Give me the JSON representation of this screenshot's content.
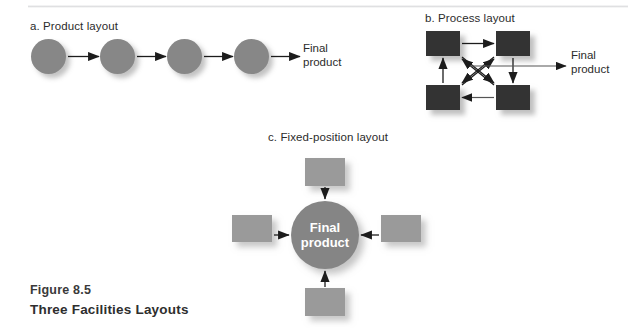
{
  "figure": {
    "caption_line1": "Figure 8.5",
    "caption_line2": "Three Facilities Layouts"
  },
  "panels": {
    "a": {
      "label": "a. Product layout",
      "output_label_line1": "Final",
      "output_label_line2": "product",
      "node_count": 4,
      "node_shape": "circle",
      "node_color": "#878787",
      "flow": "linear-sequence"
    },
    "b": {
      "label": "b. Process layout",
      "output_label_line1": "Final",
      "output_label_line2": "product",
      "node_count": 4,
      "node_shape": "square",
      "node_color": "#333333",
      "flow": "cyclic-with-diagonals"
    },
    "c": {
      "label": "c. Fixed-position layout",
      "center_label_line1": "Final",
      "center_label_line2": "product",
      "node_count": 4,
      "node_shape": "square",
      "node_color": "#9a9a9a",
      "center_color": "#858585",
      "flow": "inward-converging"
    }
  },
  "colors": {
    "background": "#ffffff",
    "arrow": "#1c1c1c",
    "text": "#2b2b2b",
    "caption": "#3a3a3a"
  }
}
